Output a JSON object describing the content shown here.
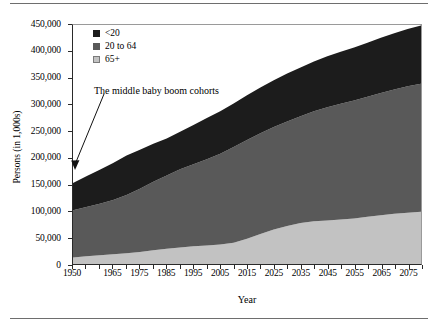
{
  "figure": {
    "y_axis_title": "Persons (in 1,000s)",
    "x_axis_title": "Year",
    "annotation": "The middle baby boom cohorts"
  },
  "legend": {
    "items": [
      {
        "label": "<20",
        "color": "#1c1c1c"
      },
      {
        "label": "20 to 64",
        "color": "#595959"
      },
      {
        "label": "65+",
        "color": "#c2c2c2"
      }
    ]
  },
  "colors": {
    "under20": "#1c1c1c",
    "adults": "#595959",
    "seniors": "#c2c2c2",
    "axis": "#2a2a2a",
    "rule": "#6e6e6e",
    "background": "#ffffff"
  },
  "chart_data": {
    "type": "area",
    "stacked": true,
    "title": "",
    "xlabel": "Year",
    "ylabel": "Persons (in 1,000s)",
    "xlim": [
      1950,
      2080
    ],
    "ylim": [
      0,
      450000
    ],
    "ytick_step": 50000,
    "grid": false,
    "legend_position": "top-left",
    "annotations": [
      {
        "text": "The middle baby boom cohorts",
        "x": 1950,
        "y": 152000,
        "arrow": true
      }
    ],
    "y_ticks": [
      "0",
      "50,000",
      "100,000",
      "150,000",
      "200,000",
      "250,000",
      "300,000",
      "350,000",
      "400,000",
      "450,000"
    ],
    "y_tick_values": [
      0,
      50000,
      100000,
      150000,
      200000,
      250000,
      300000,
      350000,
      400000,
      450000
    ],
    "x_ticks": [
      "1950",
      "1965",
      "1975",
      "1985",
      "1995",
      "2005",
      "2015",
      "2025",
      "2035",
      "2045",
      "2055",
      "2065",
      "2075"
    ],
    "x_tick_values": [
      1950,
      1965,
      1975,
      1985,
      1995,
      2005,
      2015,
      2025,
      2035,
      2045,
      2055,
      2065,
      2075
    ],
    "x": [
      1950,
      1955,
      1960,
      1965,
      1970,
      1975,
      1980,
      1985,
      1990,
      1995,
      2000,
      2005,
      2010,
      2015,
      2020,
      2025,
      2030,
      2035,
      2040,
      2045,
      2050,
      2055,
      2060,
      2065,
      2070,
      2075,
      2080
    ],
    "series": [
      {
        "name": "65+",
        "color": "#c2c2c2",
        "values": [
          12300,
          14500,
          16600,
          18400,
          20100,
          22700,
          25700,
          28500,
          31200,
          33600,
          35000,
          36800,
          40200,
          47700,
          56400,
          65000,
          71500,
          77200,
          80400,
          82000,
          83600,
          85800,
          88800,
          92000,
          94600,
          96600,
          98200
        ]
      },
      {
        "name": "20 to 64",
        "color": "#595959",
        "values": [
          89000,
          93000,
          97000,
          102000,
          110000,
          119000,
          129000,
          138000,
          147000,
          154000,
          162000,
          171000,
          180000,
          186000,
          190000,
          193000,
          197000,
          201000,
          207000,
          213000,
          218000,
          222000,
          226000,
          230000,
          234000,
          238000,
          241000
        ]
      },
      {
        "name": "<20",
        "color": "#1c1c1c",
        "values": [
          51000,
          57500,
          64000,
          70000,
          74000,
          73500,
          71500,
          70000,
          71000,
          74000,
          78000,
          80000,
          82000,
          84000,
          86000,
          88000,
          90000,
          92000,
          94000,
          96000,
          98000,
          100000,
          102000,
          104000,
          106000,
          108000,
          110000
        ]
      }
    ],
    "totals": [
      152300,
      165000,
      177600,
      190400,
      204100,
      215200,
      226200,
      236500,
      249200,
      261600,
      275000,
      287800,
      302200,
      317700,
      332400,
      346000,
      358500,
      370200,
      381400,
      391000,
      399600,
      407800,
      416800,
      426000,
      434600,
      442600,
      449200
    ]
  }
}
